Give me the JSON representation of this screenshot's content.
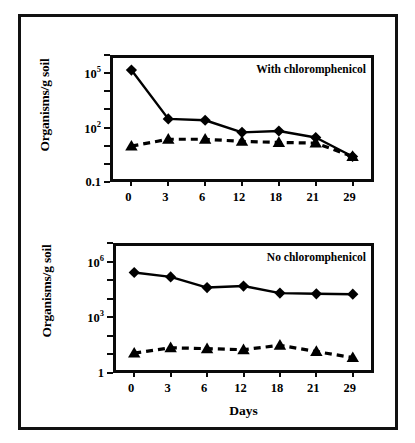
{
  "figure": {
    "xlabel": "Days",
    "ylabel": "Organisms/g soil"
  },
  "chart_data": [
    {
      "type": "line",
      "title": "With chloromphenicol",
      "panel": "top",
      "xlabel": "",
      "ylabel": "Organisms/g soil",
      "categories": [
        "0",
        "3",
        "6",
        "12",
        "18",
        "21",
        "29"
      ],
      "x": [
        0,
        3,
        6,
        12,
        18,
        21,
        29
      ],
      "yscale": "log",
      "ylim": [
        0.1,
        1000000
      ],
      "ytick_labels": [
        "10⁵",
        "10²",
        "0.1"
      ],
      "ytick_values": [
        100000,
        100,
        0.1
      ],
      "grid": false,
      "legend": "none",
      "series": [
        {
          "name": "diamond-series",
          "marker": "diamond",
          "linestyle": "solid",
          "values": [
            200000,
            300,
            250,
            50,
            60,
            25,
            2
          ]
        },
        {
          "name": "triangle-series",
          "marker": "triangle",
          "linestyle": "dashed",
          "values": [
            8,
            20,
            20,
            15,
            13,
            12,
            2
          ]
        }
      ]
    },
    {
      "type": "line",
      "title": "No chloromphenicol",
      "panel": "bottom",
      "xlabel": "Days",
      "ylabel": "Organisms/g soil",
      "categories": [
        "0",
        "3",
        "6",
        "12",
        "18",
        "21",
        "29"
      ],
      "x": [
        0,
        3,
        6,
        12,
        18,
        21,
        29
      ],
      "yscale": "log",
      "ylim": [
        1,
        10000000
      ],
      "ytick_labels": [
        "10⁶",
        "10³",
        "1"
      ],
      "ytick_values": [
        1000000,
        1000,
        1
      ],
      "grid": false,
      "legend": "none",
      "series": [
        {
          "name": "diamond-series",
          "marker": "diamond",
          "linestyle": "solid",
          "values": [
            320000,
            180000,
            45000,
            55000,
            22000,
            20000,
            19000
          ]
        },
        {
          "name": "triangle-series",
          "marker": "triangle",
          "linestyle": "dashed",
          "values": [
            9,
            18,
            16,
            14,
            25,
            11,
            5
          ]
        }
      ]
    }
  ]
}
